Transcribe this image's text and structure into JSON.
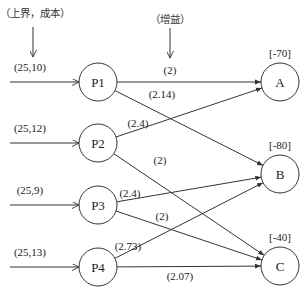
{
  "annotations": {
    "source_label": "（上界，成本）",
    "gain_label": "（增益）"
  },
  "sources": [
    {
      "id": "P1",
      "label": "P1",
      "input": "(25,10)",
      "x": 98,
      "y": 82
    },
    {
      "id": "P2",
      "label": "P2",
      "input": "(25,12)",
      "x": 98,
      "y": 143
    },
    {
      "id": "P3",
      "label": "P3",
      "input": "(25,9)",
      "x": 98,
      "y": 205
    },
    {
      "id": "P4",
      "label": "P4",
      "input": "(25,13)",
      "x": 98,
      "y": 267
    }
  ],
  "sinks": [
    {
      "id": "A",
      "label": "A",
      "demand": "[-70]",
      "x": 280,
      "y": 82
    },
    {
      "id": "B",
      "label": "B",
      "demand": "[-80]",
      "x": 280,
      "y": 174
    },
    {
      "id": "C",
      "label": "C",
      "demand": "[-40]",
      "x": 280,
      "y": 266
    }
  ],
  "edges": [
    {
      "from": "P1",
      "to": "A",
      "gain": "(2)",
      "lx": 170,
      "ly": 74
    },
    {
      "from": "P1",
      "to": "B",
      "gain": "(2.14)",
      "lx": 162,
      "ly": 98
    },
    {
      "from": "P2",
      "to": "A",
      "gain": "(2.4)",
      "lx": 138,
      "ly": 127
    },
    {
      "from": "P2",
      "to": "C",
      "gain": "(2)",
      "lx": 160,
      "ly": 164
    },
    {
      "from": "P3",
      "to": "B",
      "gain": "(2.4)",
      "lx": 130,
      "ly": 197
    },
    {
      "from": "P3",
      "to": "C",
      "gain": "(2)",
      "lx": 162,
      "ly": 220
    },
    {
      "from": "P4",
      "to": "B",
      "gain": "(2.73)",
      "lx": 128,
      "ly": 250
    },
    {
      "from": "P4",
      "to": "C",
      "gain": "(2.07)",
      "lx": 180,
      "ly": 280
    }
  ]
}
